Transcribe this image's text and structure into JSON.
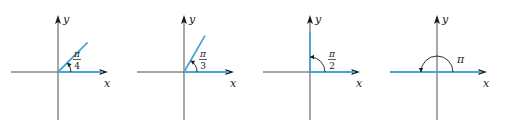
{
  "figure": {
    "axis_labels": {
      "x": "x",
      "y": "y"
    },
    "colors": {
      "ray": "#4aa6d6",
      "axis": "#3a3a3a",
      "ink": "#1a1a1a"
    },
    "panels": [
      {
        "id": "angle-pi-over-4",
        "angle_degrees": 45,
        "label": {
          "type": "fraction",
          "numerator": "π",
          "denominator": "4"
        }
      },
      {
        "id": "angle-pi-over-3",
        "angle_degrees": 60,
        "label": {
          "type": "fraction",
          "numerator": "π",
          "denominator": "3"
        }
      },
      {
        "id": "angle-pi-over-2",
        "angle_degrees": 90,
        "label": {
          "type": "fraction",
          "numerator": "π",
          "denominator": "2"
        }
      },
      {
        "id": "angle-pi",
        "angle_degrees": 180,
        "label": {
          "type": "symbol",
          "text": "π"
        }
      }
    ]
  }
}
